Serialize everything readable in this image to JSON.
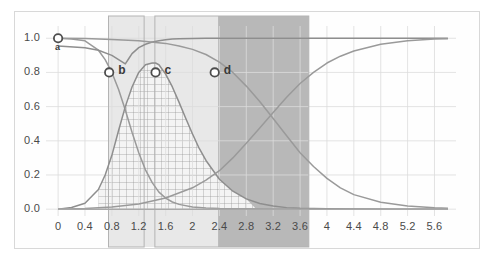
{
  "chart_data": {
    "type": "line",
    "title": "",
    "subtitle": "",
    "xlabel": "",
    "ylabel": "",
    "xlim": [
      -0.18,
      5.92
    ],
    "ylim": [
      -0.04,
      1.06
    ],
    "grid": true,
    "legend_position": "none",
    "xticks": [
      "0",
      "0.4",
      "0.8",
      "1.2",
      "1.6",
      "2",
      "2.4",
      "2.8",
      "3.2",
      "3.6",
      "4",
      "4.4",
      "4.8",
      "5.2",
      "5.6"
    ],
    "xtick_values": [
      0,
      0.4,
      0.8,
      1.2,
      1.6,
      2.0,
      2.4,
      2.8,
      3.2,
      3.6,
      4.0,
      4.4,
      4.8,
      5.2,
      5.6
    ],
    "yticks": [
      "0.0",
      "0.2",
      "0.4",
      "0.6",
      "0.8",
      "1.0"
    ],
    "ytick_values": [
      0.0,
      0.2,
      0.4,
      0.6,
      0.8,
      1.0
    ],
    "series": [
      {
        "name": "falling-sigmoid-near",
        "color": "#9a9a9a",
        "x": [
          0.0,
          0.2,
          0.4,
          0.6,
          0.7,
          0.8,
          0.9,
          1.0,
          1.1,
          1.2,
          1.3,
          1.4,
          1.5,
          1.6,
          1.7,
          1.8,
          2.0,
          2.2,
          2.4,
          2.8,
          3.2,
          3.6,
          4.0,
          5.0,
          5.8
        ],
        "y": [
          1.0,
          0.995,
          0.985,
          0.93,
          0.875,
          0.8,
          0.7,
          0.58,
          0.45,
          0.33,
          0.23,
          0.155,
          0.1,
          0.065,
          0.042,
          0.028,
          0.013,
          0.007,
          0.004,
          0.002,
          0.001,
          0.001,
          0.0,
          0.0,
          0.0
        ]
      },
      {
        "name": "bell-peak-1p45",
        "color": "#8e8e8e",
        "x": [
          0.0,
          0.2,
          0.4,
          0.6,
          0.7,
          0.8,
          0.9,
          1.0,
          1.1,
          1.2,
          1.3,
          1.4,
          1.45,
          1.5,
          1.6,
          1.7,
          1.8,
          1.9,
          2.0,
          2.1,
          2.2,
          2.4,
          2.6,
          2.8,
          3.0,
          3.2,
          3.4,
          3.6,
          4.0,
          4.4,
          5.0,
          5.8
        ],
        "y": [
          0.0,
          0.01,
          0.035,
          0.115,
          0.2,
          0.315,
          0.46,
          0.6,
          0.715,
          0.8,
          0.845,
          0.855,
          0.855,
          0.845,
          0.79,
          0.715,
          0.625,
          0.53,
          0.44,
          0.355,
          0.285,
          0.175,
          0.105,
          0.06,
          0.033,
          0.018,
          0.009,
          0.005,
          0.002,
          0.001,
          0.0,
          0.0
        ]
      },
      {
        "name": "rising-sigmoid-mid",
        "color": "#8e8e8e",
        "x": [
          0.0,
          0.4,
          0.6,
          0.8,
          0.9,
          1.0,
          1.05,
          1.1,
          1.2,
          1.3,
          1.4,
          1.5,
          1.6,
          1.7,
          1.8,
          2.0,
          2.2,
          2.6,
          3.0,
          3.6,
          4.4,
          5.2,
          5.8
        ],
        "y": [
          0.955,
          0.945,
          0.93,
          0.9,
          0.875,
          0.85,
          0.88,
          0.91,
          0.945,
          0.965,
          0.978,
          0.986,
          0.991,
          0.995,
          0.997,
          0.999,
          1.0,
          1.0,
          1.0,
          1.0,
          1.0,
          1.0,
          1.0
        ]
      },
      {
        "name": "falling-sigmoid-far",
        "color": "#9a9a9a",
        "x": [
          0.0,
          0.4,
          0.8,
          1.2,
          1.6,
          1.8,
          2.0,
          2.2,
          2.4,
          2.6,
          2.8,
          3.0,
          3.2,
          3.4,
          3.6,
          3.8,
          4.0,
          4.2,
          4.4,
          4.8,
          5.2,
          5.6,
          5.8
        ],
        "y": [
          1.0,
          0.998,
          0.993,
          0.985,
          0.97,
          0.955,
          0.935,
          0.905,
          0.86,
          0.8,
          0.72,
          0.63,
          0.53,
          0.43,
          0.33,
          0.25,
          0.18,
          0.125,
          0.085,
          0.04,
          0.018,
          0.008,
          0.005
        ]
      },
      {
        "name": "rising-slow-far",
        "color": "#9a9a9a",
        "x": [
          0.0,
          0.4,
          0.8,
          1.2,
          1.6,
          2.0,
          2.2,
          2.4,
          2.6,
          2.8,
          3.0,
          3.2,
          3.4,
          3.6,
          3.8,
          4.0,
          4.2,
          4.4,
          4.8,
          5.2,
          5.6,
          5.8
        ],
        "y": [
          0.0,
          0.004,
          0.012,
          0.03,
          0.065,
          0.125,
          0.17,
          0.225,
          0.3,
          0.385,
          0.475,
          0.565,
          0.655,
          0.735,
          0.8,
          0.855,
          0.895,
          0.925,
          0.965,
          0.985,
          0.995,
          0.997
        ]
      },
      {
        "name": "baseline-zero",
        "color": "#a8a8a8",
        "x": [
          0.0,
          5.8
        ],
        "y": [
          0.0,
          0.0
        ]
      }
    ],
    "markers": [
      {
        "id": "a",
        "label": "a",
        "x": 0.0,
        "y": 1.0,
        "label_position": "below"
      },
      {
        "id": "b",
        "label": "b",
        "x": 0.76,
        "y": 0.8,
        "label_position": "right"
      },
      {
        "id": "c",
        "label": "c",
        "x": 1.45,
        "y": 0.8,
        "label_position": "right"
      },
      {
        "id": "d",
        "label": "d",
        "x": 2.33,
        "y": 0.8,
        "label_position": "right"
      }
    ],
    "annotations": [
      {
        "name": "support-box-b",
        "type": "rect-outline",
        "x0": 0.75,
        "x1": 1.28,
        "fill": "none",
        "stroke": "#b3b3b3"
      },
      {
        "name": "support-box-c",
        "type": "rect-outline",
        "x0": 1.44,
        "x1": 3.73,
        "fill": "none",
        "stroke": "#b3b3b3"
      },
      {
        "name": "shaded-band-light",
        "type": "rect-fill",
        "x0": 0.75,
        "x1": 2.38,
        "fill": "#e8e8e8"
      },
      {
        "name": "shaded-band-dark",
        "type": "rect-fill",
        "x0": 2.38,
        "x1": 3.73,
        "fill": "#b8b8b8"
      },
      {
        "name": "hatched-region",
        "type": "crosshatch",
        "x0": 0.6,
        "x1": 2.95,
        "fill": "#f2f2f2",
        "stroke": "#8c8c8c"
      }
    ],
    "colors": {
      "curve_primary": "#8e8e8e",
      "curve_secondary": "#9a9a9a",
      "grid": "#dcdcdc",
      "axis_text": "#4a4a4a",
      "band_light": "#e8e8e8",
      "band_dark": "#b8b8b8",
      "marker_ring": "#4d4d4d"
    }
  }
}
